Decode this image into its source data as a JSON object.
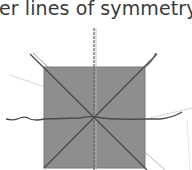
{
  "caption": {
    "text": "er lines of symmetry to"
  },
  "figure": {
    "shape": "square",
    "fill_color": "#8e8e8e",
    "square_bounds": {
      "x": 44,
      "y": 67,
      "width": 101,
      "height": 101
    },
    "line_color": "#4a4a4a",
    "faint_line_color": "#cfcfcf",
    "lines_of_symmetry": [
      {
        "name": "vertical",
        "x1": 94,
        "y1": 30,
        "x2": 94,
        "y2": 170
      },
      {
        "name": "horizontal",
        "x1": 6,
        "y1": 119,
        "x2": 182,
        "y2": 118
      },
      {
        "name": "diagonal-1",
        "x1": 30,
        "y1": 54,
        "x2": 147,
        "y2": 170
      },
      {
        "name": "diagonal-2",
        "x1": 156,
        "y1": 54,
        "x2": 44,
        "y2": 168
      }
    ]
  }
}
